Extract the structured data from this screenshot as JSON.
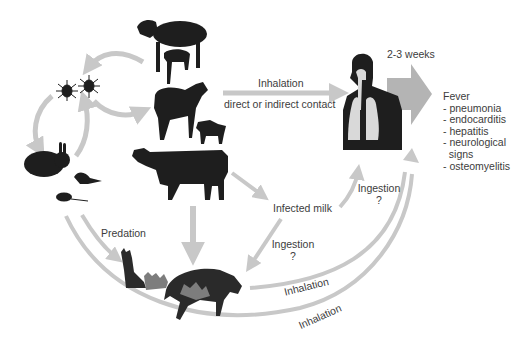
{
  "diagram": {
    "colors": {
      "arrow": "#c8c8c8",
      "big_arrow": "#b4b4b4",
      "silhouette": "#1e1e1e",
      "lung": "#d9d9d9",
      "kitten": "#7d7d7d",
      "text": "#3c3c3c"
    },
    "nodes": {
      "domestic_ruminants": [
        "sheep-with-lamb",
        "goat-with-kid",
        "cow"
      ],
      "ticks": "ticks",
      "wild_animals": [
        "rabbit",
        "bird",
        "rodent"
      ],
      "pets": [
        "cat-with-kittens",
        "dog-with-puppies"
      ],
      "human": "human-respiratory-system",
      "milk": "Infected milk"
    },
    "labels": {
      "inhalation_top": "Inhalation",
      "contact": "direct or indirect contact",
      "incubation": "2-3 weeks",
      "infected_milk": "Infected milk",
      "ingestion_human": "Ingestion",
      "ingestion_human_q": "?",
      "ingestion_pet": "Ingestion",
      "ingestion_pet_q": "?",
      "predation": "Predation",
      "inhalation_pets": "Inhalation",
      "inhalation_wild": "Inhalation"
    },
    "outcomes": {
      "title": "Fever",
      "items": [
        "- pneumonia",
        "- endocarditis",
        "- hepatitis",
        "- neurological",
        "  signs",
        "- osteomyelitis"
      ]
    }
  }
}
